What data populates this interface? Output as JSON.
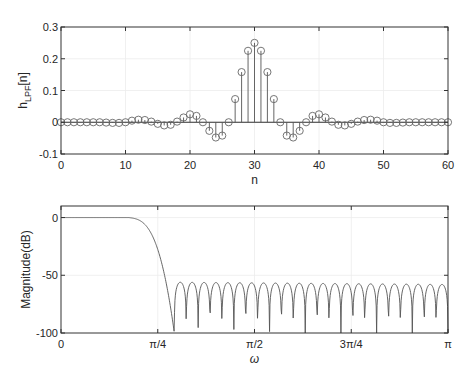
{
  "chart_data": [
    {
      "type": "stem",
      "title": "",
      "xlabel": "n",
      "ylabel": "h_LPF[n]",
      "ylabel_main": "h",
      "ylabel_sub": "LPF",
      "ylabel_tail": "[n]",
      "xlim": [
        0,
        60
      ],
      "ylim": [
        -0.1,
        0.3
      ],
      "xticks": [
        0,
        10,
        20,
        30,
        40,
        50,
        60
      ],
      "yticks": [
        -0.1,
        0,
        0.1,
        0.2,
        0.3
      ],
      "ytick_labels": [
        "-0.1",
        "0",
        "0.1",
        "0.2",
        "0.3"
      ],
      "grid": true,
      "x": [
        0,
        1,
        2,
        3,
        4,
        5,
        6,
        7,
        8,
        9,
        10,
        11,
        12,
        13,
        14,
        15,
        16,
        17,
        18,
        19,
        20,
        21,
        22,
        23,
        24,
        25,
        26,
        27,
        28,
        29,
        30,
        31,
        32,
        33,
        34,
        35,
        36,
        37,
        38,
        39,
        40,
        41,
        42,
        43,
        44,
        45,
        46,
        47,
        48,
        49,
        50,
        51,
        52,
        53,
        54,
        55,
        56,
        57,
        58,
        59,
        60
      ],
      "values": [
        0,
        0,
        0,
        0,
        0,
        0,
        0,
        -0.001,
        -0.002,
        -0.002,
        0,
        0.005,
        0.008,
        0.007,
        0.002,
        -0.005,
        -0.01,
        -0.008,
        0.002,
        0.015,
        0.025,
        0.02,
        0,
        -0.027,
        -0.048,
        -0.042,
        0,
        0.073,
        0.158,
        0.225,
        0.25,
        0.225,
        0.158,
        0.073,
        0,
        -0.042,
        -0.048,
        -0.027,
        0,
        0.02,
        0.025,
        0.015,
        0.002,
        -0.008,
        -0.01,
        -0.005,
        0.002,
        0.007,
        0.008,
        0.005,
        0,
        -0.002,
        -0.002,
        -0.001,
        0,
        0,
        0,
        0,
        0,
        0,
        0
      ]
    },
    {
      "type": "line",
      "title": "",
      "xlabel": "ω",
      "ylabel": "Magnitude(dB)",
      "xlim": [
        0,
        3.14159
      ],
      "ylim": [
        -100,
        10
      ],
      "xtick_labels": [
        "0",
        "π/4",
        "π/2",
        "3π/4",
        "π"
      ],
      "yticks": [
        0,
        -50,
        -100
      ],
      "ytick_labels": [
        "0",
        "-50",
        "-100"
      ],
      "grid": true,
      "description": "Lowpass FIR magnitude response: 0 dB passband to ~0.22π, rolls off to first null near 0.3π, stopband ripple with sidelobes peaking around -55 to -60 dB and ~23 nulls reaching -100 dB",
      "passband_db": 0,
      "passband_edge_rad": 0.2,
      "first_null_rad": 0.92,
      "stopband_peak_db": -56,
      "stopband_nulls": 23
    }
  ],
  "labels": {
    "top_xlabel": "n",
    "bottom_xlabel": "ω",
    "bottom_ylabel": "Magnitude(dB)"
  }
}
